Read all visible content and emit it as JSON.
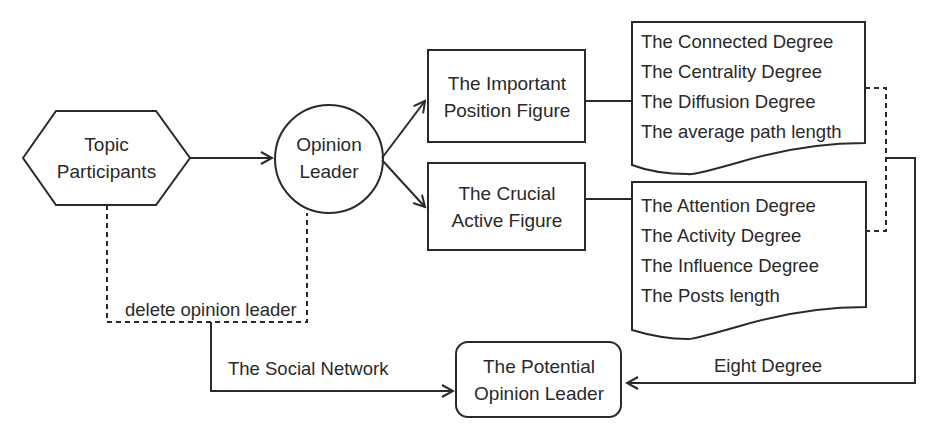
{
  "nodes": {
    "topic_participants": {
      "line1": "Topic",
      "line2": "Participants",
      "shape": "hexagon"
    },
    "opinion_leader": {
      "line1": "Opinion",
      "line2": "Leader",
      "shape": "circle"
    },
    "important_position_figure": {
      "line1": "The Important",
      "line2": "Position Figure",
      "shape": "rectangle"
    },
    "crucial_active_figure": {
      "line1": "The Crucial",
      "line2": "Active Figure",
      "shape": "rectangle"
    },
    "potential_opinion_leader": {
      "line1": "The Potential",
      "line2": "Opinion Leader",
      "shape": "rounded-rectangle"
    }
  },
  "documents": {
    "position_metrics": {
      "items": [
        "The Connected Degree",
        "The Centrality Degree",
        "The Diffusion Degree",
        "The average path length"
      ]
    },
    "activity_metrics": {
      "items": [
        "The Attention Degree",
        "The Activity Degree",
        "The Influence Degree",
        "The Posts length"
      ]
    }
  },
  "edge_labels": {
    "delete": "delete opinion leader",
    "social_network": "The Social Network",
    "eight_degree": "Eight Degree"
  },
  "colors": {
    "stroke": "#2a2a2a",
    "background": "#ffffff"
  }
}
